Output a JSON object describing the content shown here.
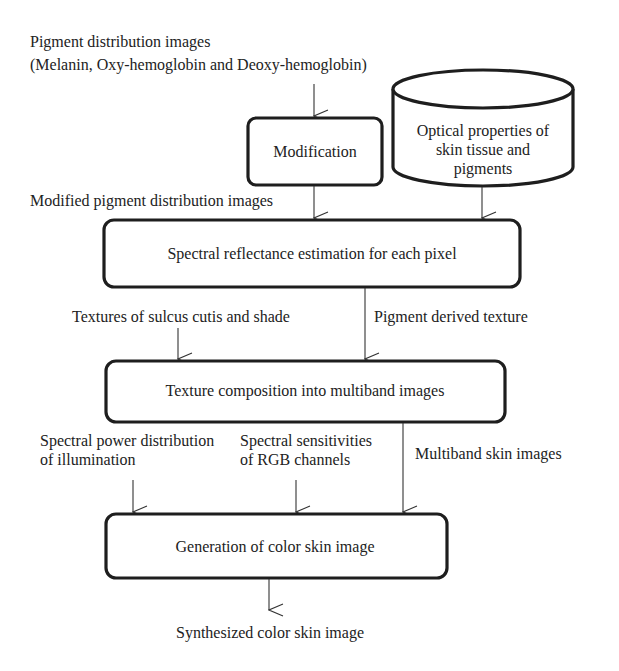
{
  "diagram": {
    "inputs": {
      "pigment_title": "Pigment distribution images",
      "pigment_subtitle": "(Melanin, Oxy-hemoglobin and Deoxy-hemoglobin)",
      "modified_images": "Modified pigment distribution images",
      "textures_sulcus": "Textures of sulcus cutis and shade",
      "pigment_texture": "Pigment derived texture",
      "spd_line1": "Spectral power distribution",
      "spd_line2": "of illumination",
      "rgb_line1": "Spectral sensitivities",
      "rgb_line2": "of RGB channels",
      "multiband": "Multiband skin images",
      "output": "Synthesized color skin image"
    },
    "nodes": {
      "modification": "Modification",
      "optical_line1": "Optical properties of",
      "optical_line2": "skin tissue and",
      "optical_line3": "pigments",
      "spectral": "Spectral reflectance estimation for each pixel",
      "texture": "Texture composition into multiband images",
      "generation": "Generation of color skin image"
    },
    "colors": {
      "stroke": "#1e1e1e",
      "text": "#222222",
      "background": "#ffffff"
    }
  }
}
